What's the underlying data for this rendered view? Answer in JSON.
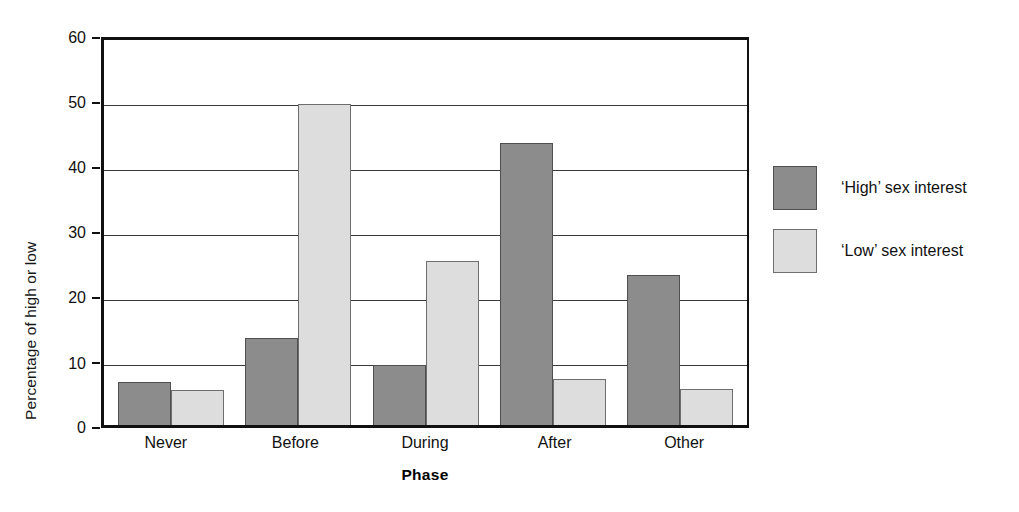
{
  "chart_data": {
    "type": "bar",
    "title": "",
    "xlabel": "Phase",
    "ylabel": "Percentage of high or low",
    "categories": [
      "Never",
      "Before",
      "During",
      "After",
      "Other"
    ],
    "series": [
      {
        "name": "‘High’ sex interest",
        "color": "#8c8c8c",
        "values": [
          6.7,
          13.5,
          9.3,
          44.0,
          23.4
        ]
      },
      {
        "name": "‘Low’ sex interest",
        "color": "#dddddd",
        "values": [
          5.4,
          50.0,
          25.5,
          7.1,
          5.6
        ]
      }
    ],
    "ylim": [
      0,
      60
    ],
    "yticks": [
      0,
      10,
      20,
      30,
      40,
      50,
      60
    ],
    "ytick_labels": [
      "0",
      "10",
      "20",
      "30",
      "40",
      "50",
      "60"
    ],
    "grid": true,
    "legend_position": "right"
  },
  "legend": {
    "items": [
      {
        "label": "‘High’ sex interest",
        "swatch": "high"
      },
      {
        "label": "‘Low’ sex interest",
        "swatch": "low"
      }
    ]
  }
}
